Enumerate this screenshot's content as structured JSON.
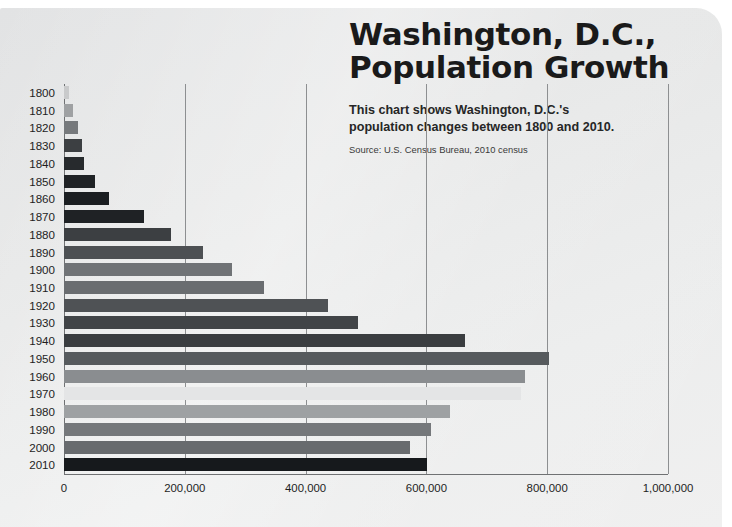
{
  "header": {
    "title_line1": "Washington, D.C.,",
    "title_line2": "Population Growth",
    "subtitle": "This chart shows Washington, D.C.'s population changes between 1800 and 2010.",
    "source": "Source: U.S. Census Bureau, 2010 census"
  },
  "colors": {
    "page_background": "#ffffff",
    "card_background": "#e9eaea",
    "text": "#1a1a1a",
    "gridline": "#8d8f91",
    "axis": "#6f7173"
  },
  "chart_data": {
    "type": "bar",
    "orientation": "horizontal",
    "title": "Washington, D.C., Population Growth",
    "subtitle": "This chart shows Washington, D.C.'s population changes between 1800 and 2010.",
    "source": "Source: U.S. Census Bureau, 2010 census",
    "xlabel": "",
    "ylabel": "",
    "xlim": [
      0,
      1000000
    ],
    "grid": true,
    "legend": false,
    "xticks": [
      0,
      200000,
      400000,
      600000,
      800000,
      1000000
    ],
    "xtick_labels": [
      "0",
      "200,000",
      "400,000",
      "600,000",
      "800,000",
      "1,000,000"
    ],
    "categories": [
      "1800",
      "1810",
      "1820",
      "1830",
      "1840",
      "1850",
      "1860",
      "1870",
      "1880",
      "1890",
      "1900",
      "1910",
      "1920",
      "1930",
      "1940",
      "1950",
      "1960",
      "1970",
      "1980",
      "1990",
      "2000",
      "2010"
    ],
    "values": [
      8144,
      15471,
      23336,
      30261,
      33745,
      51687,
      75080,
      131700,
      177624,
      230392,
      278718,
      331069,
      437571,
      486869,
      663091,
      802178,
      763956,
      756510,
      638333,
      606900,
      572059,
      601723
    ],
    "bar_colors": [
      "#c9cacb",
      "#9fa1a3",
      "#76797c",
      "#3c3f42",
      "#272a2d",
      "#1f2225",
      "#1b1e21",
      "#1f2225",
      "#3c3f42",
      "#4d5053",
      "#707376",
      "#6a6d70",
      "#4f5255",
      "#414447",
      "#3a3d40",
      "#565a5d",
      "#8a8d90",
      "#e4e5e6",
      "#9ea1a3",
      "#75787b",
      "#686b6e",
      "#16191c"
    ]
  }
}
